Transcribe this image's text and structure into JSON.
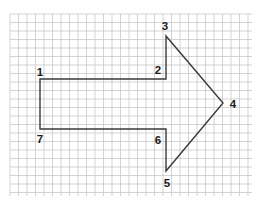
{
  "diagram": {
    "type": "block-arrow-on-grid-paper",
    "grid": {
      "x_start": 10,
      "x_end": 252,
      "y_start": 14,
      "y_end": 196,
      "spacing": 8.5,
      "color": "#c8c8c8"
    },
    "shape": {
      "stroke_color": "#3a3a3a",
      "vertices": [
        {
          "id": "1",
          "x": 40,
          "y": 79
        },
        {
          "id": "2",
          "x": 166,
          "y": 79
        },
        {
          "id": "3",
          "x": 166,
          "y": 36
        },
        {
          "id": "4",
          "x": 223,
          "y": 103
        },
        {
          "id": "5",
          "x": 166,
          "y": 171
        },
        {
          "id": "6",
          "x": 166,
          "y": 129
        },
        {
          "id": "7",
          "x": 40,
          "y": 129
        }
      ]
    },
    "labels": [
      {
        "text": "1",
        "x": 40,
        "y": 72
      },
      {
        "text": "2",
        "x": 158,
        "y": 70
      },
      {
        "text": "3",
        "x": 165,
        "y": 26
      },
      {
        "text": "4",
        "x": 233,
        "y": 104
      },
      {
        "text": "5",
        "x": 167,
        "y": 183
      },
      {
        "text": "6",
        "x": 158,
        "y": 140
      },
      {
        "text": "7",
        "x": 40,
        "y": 139
      }
    ]
  }
}
